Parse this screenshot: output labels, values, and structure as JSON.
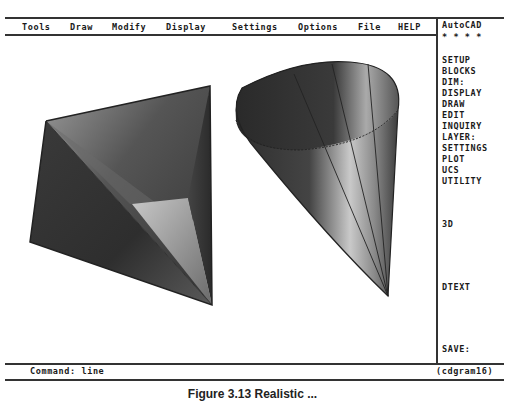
{
  "menubar": {
    "items": [
      {
        "label": "Tools"
      },
      {
        "label": "Draw"
      },
      {
        "label": "Modify"
      },
      {
        "label": "Display"
      },
      {
        "label": "Settings"
      },
      {
        "label": "Options"
      },
      {
        "label": "File"
      },
      {
        "label": "HELP"
      }
    ]
  },
  "side_menu": {
    "title": "AutoCAD",
    "stars": "* * * *",
    "items": [
      {
        "label": "SETUP"
      },
      {
        "label": "BLOCKS"
      },
      {
        "label": "DIM:"
      },
      {
        "label": "DISPLAY"
      },
      {
        "label": "DRAW"
      },
      {
        "label": "EDIT"
      },
      {
        "label": "INQUIRY"
      },
      {
        "label": "LAYER:"
      },
      {
        "label": "SETTINGS"
      },
      {
        "label": "PLOT"
      },
      {
        "label": "UCS"
      },
      {
        "label": "UTILITY"
      },
      {
        "label": "3D"
      },
      {
        "label": "DTEXT"
      },
      {
        "label": "SAVE:"
      }
    ]
  },
  "command_line": {
    "prompt": "Command: line",
    "drawing_name": "(cdgram16)"
  },
  "drawing": {
    "objects": [
      {
        "name": "shaded pyramid",
        "icon": "pyramid-shape"
      },
      {
        "name": "shaded cone",
        "icon": "cone-shape"
      }
    ]
  },
  "caption": {
    "text": "Figure 3.13  Realistic ..."
  }
}
